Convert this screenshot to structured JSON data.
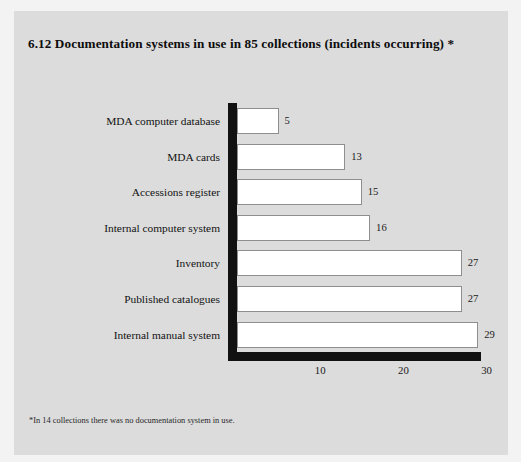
{
  "figure": {
    "number": "6.12",
    "title": "6.12  Documentation systems in use in 85 collections (incidents occurring) *",
    "footnote": "*In 14 collections there was no documentation system in use.",
    "panel_color": "#dcdcdc",
    "mat_color": "#f3f3f3",
    "axis_color": "#111111",
    "bar_fill": "#ffffff",
    "bar_stroke": "#8e8e8e"
  },
  "chart_data": {
    "type": "bar",
    "orientation": "horizontal",
    "title": "6.12  Documentation systems in use in 85 collections (incidents occurring) *",
    "xlabel": "",
    "ylabel": "",
    "xlim": [
      0,
      30
    ],
    "xticks": [
      "10",
      "20",
      "30"
    ],
    "xtick_values": [
      10,
      20,
      30
    ],
    "grid": false,
    "legend": false,
    "data_labels": true,
    "categories": [
      "MDA computer database",
      "MDA cards",
      "Accessions register",
      "Internal computer system",
      "Inventory",
      "Published catalogues",
      "Internal manual system"
    ],
    "values": [
      5,
      13,
      15,
      16,
      27,
      27,
      29
    ],
    "value_labels": [
      "5",
      "13",
      "15",
      "16",
      "27",
      "27",
      "29"
    ],
    "note": "*In 14 collections there was no documentation system in use."
  }
}
